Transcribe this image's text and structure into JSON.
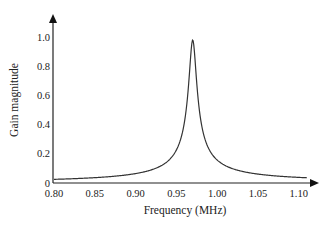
{
  "chart_data": {
    "type": "line",
    "title": "",
    "xlabel": "Frequency (MHz)",
    "ylabel": "Gain magnitude",
    "xlim": [
      0.8,
      1.12
    ],
    "ylim": [
      0,
      1.1
    ],
    "grid": false,
    "legend": null,
    "x_ticks": [
      "0.80",
      "0.85",
      "0.90",
      "0.95",
      "1.00",
      "1.05",
      "1.10"
    ],
    "y_ticks": [
      "0",
      "0.2",
      "0.4",
      "0.6",
      "0.8",
      "1.0"
    ],
    "series": [
      {
        "name": "Gain",
        "color": "#333333",
        "x": [
          0.8,
          0.85,
          0.9,
          0.93,
          0.95,
          0.96,
          0.965,
          0.97,
          0.975,
          0.98,
          0.99,
          1.0,
          1.02,
          1.05,
          1.08,
          1.11
        ],
        "values": [
          0.025,
          0.037,
          0.065,
          0.115,
          0.229,
          0.427,
          0.68,
          0.98,
          0.68,
          0.43,
          0.235,
          0.159,
          0.097,
          0.062,
          0.045,
          0.036
        ]
      }
    ],
    "annotations": []
  }
}
